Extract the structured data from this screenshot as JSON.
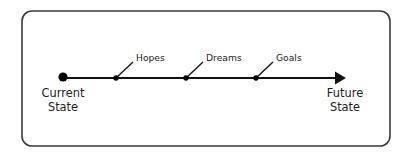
{
  "diagram": {
    "type": "timeline-arrow",
    "title_visible": false,
    "colors": {
      "background": "#ffffff",
      "border": "#3a3a3a",
      "line": "#111111",
      "node": "#000000",
      "text": "#1b1b1b"
    },
    "frame": {
      "name": "rounded-rectangle-border",
      "x": 22,
      "y": 11,
      "width": 368,
      "height": 135,
      "radius": 10,
      "stroke_width": 1.6
    },
    "axis": {
      "y": 78,
      "start_x": 63,
      "end_x": 346,
      "stroke_width": 2.1,
      "arrow": {
        "name": "arrowhead-right",
        "tip_x": 346,
        "width": 11,
        "height": 13
      }
    },
    "start_node": {
      "label_line1": "Current",
      "label_line2": "State",
      "cx": 63,
      "cy": 77,
      "r": 4.6,
      "label_x": 63,
      "label_y1": 97,
      "label_y2": 111
    },
    "end_node": {
      "label_line1": "Future",
      "label_line2": "State",
      "label_x": 345,
      "label_y1": 97,
      "label_y2": 111
    },
    "milestones": [
      {
        "label": "Hopes",
        "cx": 116,
        "cy": 78,
        "r": 2.7,
        "leader_x2": 133,
        "leader_y2": 62,
        "text_x": 136,
        "text_y": 61
      },
      {
        "label": "Dreams",
        "cx": 186,
        "cy": 78,
        "r": 2.7,
        "leader_x2": 203,
        "leader_y2": 62,
        "text_x": 206,
        "text_y": 61
      },
      {
        "label": "Goals",
        "cx": 256,
        "cy": 78,
        "r": 2.7,
        "leader_x2": 273,
        "leader_y2": 62,
        "text_x": 276,
        "text_y": 61
      }
    ]
  }
}
